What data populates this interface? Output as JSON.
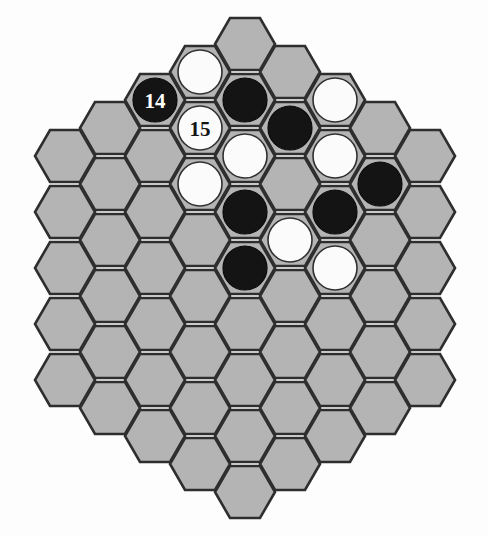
{
  "board": {
    "title": "Hex Board Position",
    "game": "Hex",
    "shape": "hexagonal",
    "side_length": 5,
    "orientation": "flat-top",
    "columns": 9,
    "column_heights": [
      5,
      6,
      7,
      8,
      9,
      8,
      7,
      6,
      5
    ],
    "total_cells": 61,
    "colors": {
      "cell_fill": "#b4b4b4",
      "cell_stroke": "#2e2e2e",
      "black_stone": "#141414",
      "white_stone": "#fbfbfb",
      "white_stone_stroke": "#303030",
      "background": "#fdfdfd",
      "label_on_black": "#ffffff",
      "label_on_white": "#141414"
    },
    "geometry": {
      "origin_x": 65,
      "origin_y": 187,
      "col_pitch": 45,
      "row_pitch": 56,
      "hex_radius": 30,
      "stone_radius": 22
    }
  },
  "stones": [
    {
      "id": "s1",
      "col": 3,
      "row": 0,
      "color": "white",
      "label": ""
    },
    {
      "id": "s2",
      "col": 2,
      "row": 0,
      "color": "black",
      "label": "14"
    },
    {
      "id": "s3",
      "col": 3,
      "row": 1,
      "color": "white",
      "label": "15"
    },
    {
      "id": "s4",
      "col": 4,
      "row": 1,
      "color": "black",
      "label": ""
    },
    {
      "id": "s5",
      "col": 5,
      "row": 1,
      "color": "black",
      "label": ""
    },
    {
      "id": "s6",
      "col": 6,
      "row": 0,
      "color": "white",
      "label": ""
    },
    {
      "id": "s7",
      "col": 4,
      "row": 2,
      "color": "white",
      "label": ""
    },
    {
      "id": "s8",
      "col": 6,
      "row": 1,
      "color": "white",
      "label": ""
    },
    {
      "id": "s9",
      "col": 3,
      "row": 2,
      "color": "white",
      "label": ""
    },
    {
      "id": "s10",
      "col": 7,
      "row": 1,
      "color": "black",
      "label": ""
    },
    {
      "id": "s11",
      "col": 4,
      "row": 3,
      "color": "black",
      "label": ""
    },
    {
      "id": "s12",
      "col": 6,
      "row": 2,
      "color": "black",
      "label": ""
    },
    {
      "id": "s13",
      "col": 5,
      "row": 3,
      "color": "white",
      "label": ""
    },
    {
      "id": "s14",
      "col": 4,
      "row": 4,
      "color": "black",
      "label": ""
    },
    {
      "id": "s15",
      "col": 6,
      "row": 3,
      "color": "white",
      "label": ""
    }
  ],
  "legend": {
    "black_label": "Black stone",
    "white_label": "White stone",
    "numbered_note": "Numbered stones mark move order"
  },
  "move_markers": [
    {
      "number": "14",
      "color": "black"
    },
    {
      "number": "15",
      "color": "white"
    }
  ]
}
